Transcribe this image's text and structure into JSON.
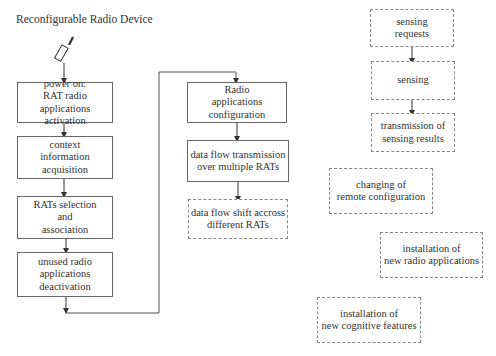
{
  "title": "Reconfigurable Radio Device",
  "device_icon": "mobile-phone-icon",
  "left_flow": [
    {
      "lines": [
        "power on:",
        "RAT radio",
        "applications activation"
      ],
      "style": "solid"
    },
    {
      "lines": [
        "context",
        "information",
        "acquisition"
      ],
      "style": "solid"
    },
    {
      "lines": [
        "RATs selection",
        "and",
        "association"
      ],
      "style": "solid"
    },
    {
      "lines": [
        "unused radio",
        "applications",
        "deactivation"
      ],
      "style": "solid"
    }
  ],
  "middle_flow": [
    {
      "lines": [
        "Radio",
        "applications",
        "configuration"
      ],
      "style": "solid"
    },
    {
      "lines": [
        "data flow transmission",
        "over multiple RATs"
      ],
      "style": "solid"
    },
    {
      "lines": [
        "data flow shift accross",
        "different RATs"
      ],
      "style": "dashed"
    }
  ],
  "right_flow": [
    {
      "lines": [
        "sensing",
        "requests"
      ],
      "style": "dashed"
    },
    {
      "lines": [
        "sensing"
      ],
      "style": "dashed"
    },
    {
      "lines": [
        "transmission of",
        "sensing results"
      ],
      "style": "dashed"
    }
  ],
  "standalone": [
    {
      "lines": [
        "changing of",
        "remote configuration"
      ],
      "style": "dashed"
    },
    {
      "lines": [
        "installation of",
        "new radio applications"
      ],
      "style": "dashed"
    },
    {
      "lines": [
        "installation of",
        "new cognitive features"
      ],
      "style": "dashed"
    }
  ]
}
